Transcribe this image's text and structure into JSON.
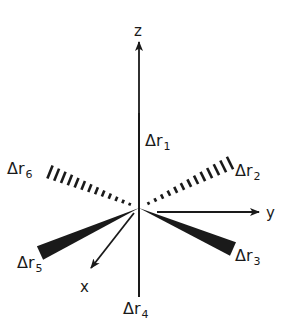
{
  "diagram": {
    "type": "octahedral-coordinate-displacements",
    "colors": {
      "ink": "#1a1a1a",
      "background": "#ffffff"
    },
    "center": [
      139,
      208
    ],
    "axes": [
      {
        "name": "z",
        "label": "z",
        "from": [
          139,
          158
        ],
        "to": [
          139,
          42
        ],
        "label_pos": [
          134,
          36
        ]
      },
      {
        "name": "y",
        "label": "y",
        "from": [
          157,
          212
        ],
        "to": [
          259,
          212
        ],
        "label_pos": [
          266,
          218
        ]
      },
      {
        "name": "x",
        "label": "x",
        "from": [
          134,
          213
        ],
        "to": [
          91,
          268
        ],
        "label_pos": [
          80,
          292
        ]
      }
    ],
    "bonds": [
      {
        "id": "r1",
        "symbol": "Δr",
        "sub": "1",
        "style": "line",
        "to": [
          139,
          113
        ],
        "label_pos": [
          145,
          146
        ]
      },
      {
        "id": "r2",
        "symbol": "Δr",
        "sub": "2",
        "style": "hashed",
        "to": [
          230,
          163
        ],
        "label_pos": [
          235,
          176
        ]
      },
      {
        "id": "r3",
        "symbol": "Δr",
        "sub": "3",
        "style": "wedge",
        "to": [
          233,
          249
        ],
        "label_pos": [
          235,
          261
        ]
      },
      {
        "id": "r4",
        "symbol": "Δr",
        "sub": "4",
        "style": "line",
        "to": [
          139,
          297
        ],
        "label_pos": [
          123,
          314
        ]
      },
      {
        "id": "r5",
        "symbol": "Δr",
        "sub": "5",
        "style": "wedge",
        "to": [
          40,
          253
        ],
        "label_pos": [
          17,
          268
        ]
      },
      {
        "id": "r6",
        "symbol": "Δr",
        "sub": "6",
        "style": "hashed",
        "to": [
          50,
          172
        ],
        "label_pos": [
          7,
          174
        ]
      }
    ]
  }
}
